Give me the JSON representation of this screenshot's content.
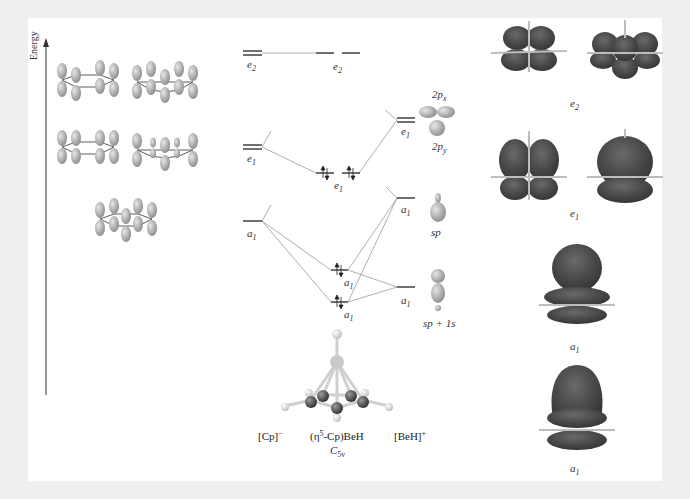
{
  "figure": {
    "axis": {
      "label": "Energy",
      "arrow": "up"
    },
    "columns": {
      "left": {
        "label": "[Cp]",
        "charge": "−"
      },
      "middle": {
        "label_prefix": "(η",
        "label_sup": "5",
        "label_suffix": "-Cp)BeH",
        "point_group": "C",
        "point_group_sub": "5v"
      },
      "right": {
        "label": "[BeH]",
        "charge": "+"
      }
    },
    "cp_levels": [
      {
        "sym": "e",
        "sub": "2",
        "degenerate": true
      },
      {
        "sym": "e",
        "sub": "1",
        "degenerate": true
      },
      {
        "sym": "a",
        "sub": "1",
        "degenerate": false
      }
    ],
    "complex_levels": [
      {
        "sym": "e",
        "sub": "2",
        "degenerate": true,
        "occupied": false
      },
      {
        "sym": "e",
        "sub": "1",
        "degenerate": true,
        "occupied": true
      },
      {
        "sym": "a",
        "sub": "1",
        "degenerate": false,
        "occupied": true
      },
      {
        "sym": "a",
        "sub": "1",
        "degenerate": false,
        "occupied": true
      }
    ],
    "beh_levels": [
      {
        "sym": "e",
        "sub": "1",
        "degenerate": true,
        "orbitals": [
          "2p_x",
          "2p_y"
        ]
      },
      {
        "sym": "a",
        "sub": "1",
        "degenerate": false,
        "orbital": "sp"
      },
      {
        "sym": "a",
        "sub": "1",
        "degenerate": false,
        "orbital": "sp + 1s"
      }
    ],
    "beh_orbital_labels": {
      "px": {
        "main": "2p",
        "sub": "x"
      },
      "py": {
        "main": "2p",
        "sub": "y"
      },
      "sp": "sp",
      "sp1s": "sp + 1s"
    },
    "mo_surfaces": [
      {
        "sym": "e",
        "sub": "2",
        "count": 2
      },
      {
        "sym": "e",
        "sub": "1",
        "count": 2
      },
      {
        "sym": "a",
        "sub": "1",
        "count": 1
      },
      {
        "sym": "a",
        "sub": "1",
        "count": 1
      }
    ],
    "colors": {
      "background": "#efefef",
      "panel": "#ffffff",
      "level_line": "#222222",
      "correlation_line": "#9a9a9a",
      "orbital_lobe": "#b5b5b5",
      "mo_surface": "#4a4a4a"
    }
  }
}
